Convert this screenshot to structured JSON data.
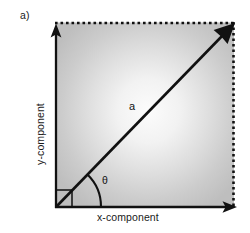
{
  "figure": {
    "panel_label": "a)",
    "vector_label": "a",
    "angle_label": "θ",
    "x_axis_label": "x-component",
    "y_axis_label": "y-component",
    "geometry": {
      "origin_x": 55,
      "origin_y": 207,
      "box_right": 234,
      "box_top": 22,
      "vector_tip_x": 234,
      "vector_tip_y": 22,
      "angle_arc_radius": 45,
      "right_angle_marker_size": 17
    },
    "colors": {
      "stroke": "#111111",
      "fill_center": "#fbfbfb",
      "fill_edge": "#c2c2c2",
      "background": "#ffffff",
      "text": "#1a1a1a"
    },
    "icon_names": {
      "y_axis_arrow": "arrow-up-icon",
      "x_axis_arrow": "arrow-right-icon",
      "vector_arrow": "arrow-diagonal-up-right-icon",
      "right_angle": "right-angle-marker-icon",
      "angle_arc": "angle-arc-icon"
    }
  }
}
